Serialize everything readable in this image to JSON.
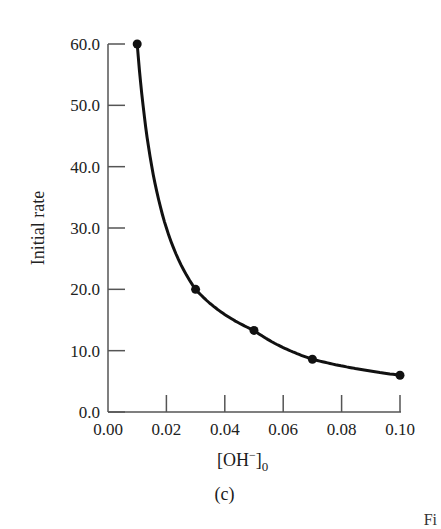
{
  "chart_data": {
    "type": "line",
    "title": "",
    "xlabel": "[OH⁻]₀",
    "ylabel": "Initial rate",
    "caption": "(c)",
    "x": [
      0.01,
      0.03,
      0.05,
      0.07,
      0.1
    ],
    "series": [
      {
        "name": "Initial rate",
        "values": [
          60.0,
          20.0,
          13.3,
          8.6,
          6.0
        ],
        "markers": true,
        "smooth": true
      }
    ],
    "xlim": [
      0.0,
      0.1
    ],
    "ylim": [
      0.0,
      60.0
    ],
    "xticks": [
      "0.00",
      "0.02",
      "0.04",
      "0.06",
      "0.08",
      "0.10"
    ],
    "yticks": [
      "0.0",
      "10.0",
      "20.0",
      "30.0",
      "40.0",
      "50.0",
      "60.0"
    ],
    "grid": false,
    "legend": null,
    "colors": {
      "line": "#111111",
      "axis": "#555555"
    }
  },
  "labels": {
    "ylabel": "Initial rate",
    "xlabel_main": "[OH",
    "xlabel_sup": "−",
    "xlabel_close": "]",
    "xlabel_sub": "0",
    "caption": "(c)",
    "corner": "Fi"
  }
}
